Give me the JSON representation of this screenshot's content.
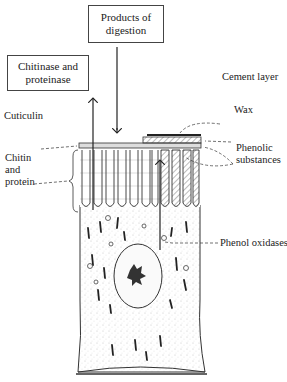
{
  "diagram": {
    "type": "labeled biological illustration",
    "boxes": [
      {
        "id": "products",
        "text": "Products of digestion"
      },
      {
        "id": "enzymes",
        "text": "Chitinase and proteinase"
      }
    ],
    "labels": {
      "cement_layer": "Cement layer",
      "wax": "Wax",
      "cuticulin": "Cuticulin",
      "phenolic_substances": "Phenolic substances",
      "chitin_protein": "Chitin and protein",
      "phenol_oxidases": "Phenol oxidases"
    },
    "colors": {
      "ink": "#222222",
      "stipple": "#9a9a9a",
      "background": "#ffffff"
    }
  }
}
